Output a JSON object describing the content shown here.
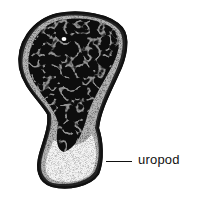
{
  "figure": {
    "colors": {
      "cell_body": "#0d0d0d",
      "cytoplasm_rim": "#bdbdbd",
      "uropod_fill": "#f2f2f2",
      "outline": "#111111",
      "background": "#ffffff"
    }
  },
  "labels": [
    {
      "text": "uropod",
      "target": "uropod"
    }
  ]
}
